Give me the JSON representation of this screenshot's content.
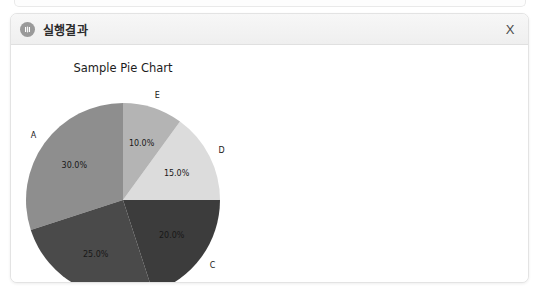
{
  "window": {
    "title": "실행결과",
    "icon": "app-circle-icon",
    "close_label": "X"
  },
  "chart_data": {
    "type": "pie",
    "title": "Sample Pie Chart",
    "categories": [
      "A",
      "B",
      "C",
      "D",
      "E"
    ],
    "values": [
      30.0,
      25.0,
      20.0,
      15.0,
      10.0
    ],
    "value_labels": [
      "30.0%",
      "25.0%",
      "20.0%",
      "15.0%",
      "10.0%"
    ],
    "colors": [
      "#8e8e8e",
      "#4a4a4a",
      "#3c3c3c",
      "#dcdcdc",
      "#b4b4b4"
    ],
    "start_angle": 90,
    "direction": "counterclockwise",
    "legend": "none",
    "grid": false,
    "xlabel": "",
    "ylabel": ""
  }
}
